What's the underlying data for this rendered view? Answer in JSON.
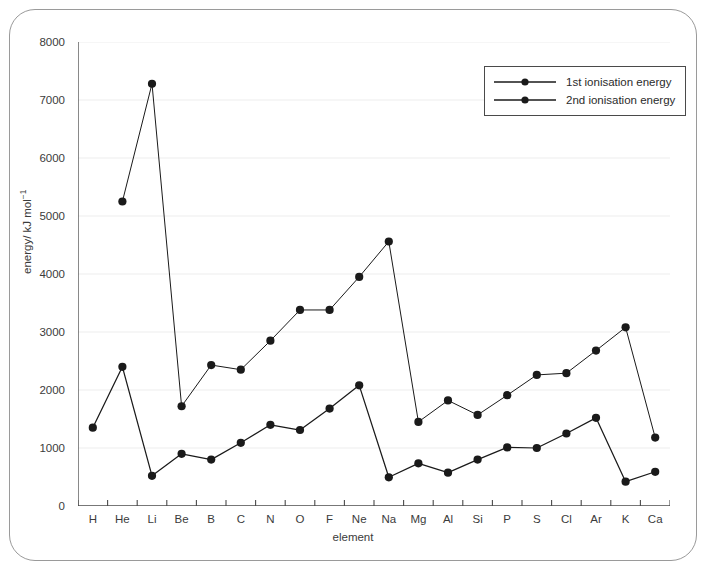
{
  "chart_data": {
    "type": "line",
    "title": "",
    "xlabel": "element",
    "ylabel": "energy/ kJ mol⁻¹",
    "ylim": [
      0,
      8000
    ],
    "yticks": [
      0,
      1000,
      2000,
      3000,
      4000,
      5000,
      6000,
      7000,
      8000
    ],
    "ytick_labels": [
      "0",
      "1000",
      "2000",
      "3000",
      "4000",
      "5000",
      "6000",
      "7000",
      "8000"
    ],
    "grid": true,
    "grid_axis": "y",
    "legend_position": "top-right",
    "categories": [
      "H",
      "He",
      "Li",
      "Be",
      "B",
      "C",
      "N",
      "O",
      "F",
      "Ne",
      "Na",
      "Mg",
      "Al",
      "Si",
      "P",
      "S",
      "Cl",
      "Ar",
      "K",
      "Ca"
    ],
    "series": [
      {
        "name": "1st ionisation energy",
        "color": "#1a1a1a",
        "marker": "circle",
        "values": [
          1350,
          2400,
          520,
          900,
          800,
          1090,
          1400,
          1310,
          1680,
          2080,
          495,
          735,
          575,
          800,
          1010,
          1000,
          1250,
          1520,
          420,
          590
        ]
      },
      {
        "name": "2nd ionisation energy",
        "color": "#1a1a1a",
        "marker": "circle",
        "values": [
          null,
          5250,
          7280,
          1720,
          2430,
          2350,
          2850,
          3380,
          3380,
          3950,
          4560,
          1450,
          1820,
          1570,
          1910,
          2260,
          2290,
          2680,
          3080,
          1180
        ]
      }
    ]
  },
  "legend": {
    "items": [
      {
        "label": "1st ionisation energy"
      },
      {
        "label": "2nd ionisation energy"
      }
    ]
  },
  "axes": {
    "x_title": "element",
    "y_title_main": "energy/ kJ mol",
    "y_title_sup": "−1"
  }
}
